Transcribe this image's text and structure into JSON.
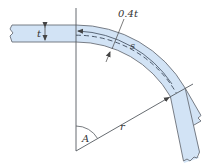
{
  "figure": {
    "labels": {
      "thickness": "t",
      "offset": "0.4t",
      "arc_length": "s",
      "angle": "A",
      "radius": "r"
    },
    "colors": {
      "beam_fill": "#d2e3f5",
      "beam_stroke": "#6a6f78",
      "line": "#555a60",
      "background": "#ffffff"
    }
  }
}
